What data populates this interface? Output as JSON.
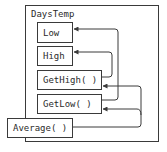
{
  "diagram": {
    "class_name": "DaysTemp",
    "members": [
      {
        "id": "low",
        "label": "Low"
      },
      {
        "id": "high",
        "label": "High"
      },
      {
        "id": "gethigh",
        "label": "GetHigh( )"
      },
      {
        "id": "getlow",
        "label": "GetLow( )"
      },
      {
        "id": "average",
        "label": "Average( )"
      }
    ],
    "connections": [
      {
        "from": "GetLow( )",
        "to": "Low"
      },
      {
        "from": "GetHigh( )",
        "to": "High"
      },
      {
        "from": "Average( )",
        "to": "GetHigh( )"
      },
      {
        "from": "Average( )",
        "to": "GetLow( )"
      }
    ],
    "colors": {
      "line": "#3a3a3a",
      "background": "#ffffff"
    }
  }
}
